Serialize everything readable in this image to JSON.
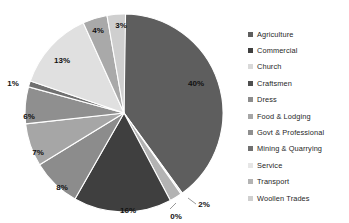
{
  "chart_data": {
    "type": "pie",
    "title": "",
    "legend_position": "right",
    "categories": [
      "Agriculture",
      "Commercial",
      "Church",
      "Craftsmen",
      "Dress",
      "Food & Lodging",
      "Govt & Professional",
      "Mining & Quarrying",
      "Service",
      "Transport",
      "Woollen Trades"
    ],
    "values": [
      40,
      16,
      0,
      13,
      8,
      7,
      6,
      1,
      4,
      2,
      3
    ],
    "data_labels": [
      "40%",
      "16%",
      "0%",
      "13%",
      "8%",
      "7%",
      "6%",
      "1%",
      "4%",
      "2%",
      "3%"
    ],
    "colors": [
      "#5e5e5e",
      "#3f3f3f",
      "#d9d9d9",
      "#4f4f4f",
      "#8c8c8c",
      "#a6a6a6",
      "#8f8f8f",
      "#707070",
      "#e6e6e6",
      "#b3b3b3",
      "#c9c9c9"
    ],
    "slices_clockwise_from_top": [
      {
        "label": "Agriculture",
        "percent": 40,
        "display": "40%",
        "color": "#5e5e5e"
      },
      {
        "label": "Church",
        "percent": 0,
        "display": "0%",
        "color": "#d9d9d9"
      },
      {
        "label": "Transport",
        "percent": 2,
        "display": "2%",
        "color": "#b3b3b3"
      },
      {
        "label": "Commercial",
        "percent": 16,
        "display": "16%",
        "color": "#3f3f3f"
      },
      {
        "label": "Dress",
        "percent": 8,
        "display": "8%",
        "color": "#8c8c8c"
      },
      {
        "label": "Food & Lodging",
        "percent": 7,
        "display": "7%",
        "color": "#a6a6a6"
      },
      {
        "label": "Govt & Professional",
        "percent": 6,
        "display": "6%",
        "color": "#8f8f8f"
      },
      {
        "label": "Mining & Quarrying",
        "percent": 1,
        "display": "1%",
        "color": "#707070"
      },
      {
        "label": "Craftsmen",
        "percent": 13,
        "display": "13%",
        "color": "#e0e0e0"
      },
      {
        "label": "Service",
        "percent": 4,
        "display": "4%",
        "color": "#a9a9a9"
      },
      {
        "label": "Woollen Trades",
        "percent": 3,
        "display": "3%",
        "color": "#cfcfcf"
      }
    ]
  },
  "legend": {
    "items": [
      {
        "label": "Agriculture",
        "color": "#5e5e5e"
      },
      {
        "label": "Commercial",
        "color": "#3f3f3f"
      },
      {
        "label": "Church",
        "color": "#d9d9d9"
      },
      {
        "label": "Craftsmen",
        "color": "#4f4f4f"
      },
      {
        "label": "Dress",
        "color": "#8c8c8c"
      },
      {
        "label": "Food & Lodging",
        "color": "#a6a6a6"
      },
      {
        "label": "Govt & Professional",
        "color": "#8f8f8f"
      },
      {
        "label": "Mining & Quarrying",
        "color": "#707070"
      },
      {
        "label": "Service",
        "color": "#e6e6e6"
      },
      {
        "label": "Transport",
        "color": "#b3b3b3"
      },
      {
        "label": "Woollen Trades",
        "color": "#cfcfcf"
      }
    ]
  },
  "labels": {
    "l40": "40%",
    "l0": "0%",
    "l2": "2%",
    "l16": "16%",
    "l8": "8%",
    "l7": "7%",
    "l6": "6%",
    "l1": "1%",
    "l13": "13%",
    "l4": "4%",
    "l3": "3%"
  }
}
